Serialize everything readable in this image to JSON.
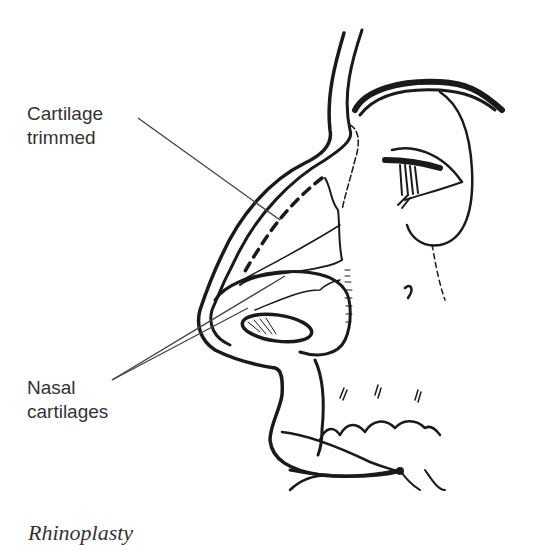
{
  "figure": {
    "caption": "Rhinoplasty",
    "labels": [
      {
        "lines": [
          "Cartilage",
          "trimmed"
        ],
        "points_to": "dashed line along nasal bridge"
      },
      {
        "lines": [
          "Nasal",
          "cartilages"
        ],
        "points_to": "lower nasal cartilages (two leader lines)"
      }
    ]
  },
  "colors": {
    "ink": "#1a1a1a",
    "label_text": "#333333",
    "leader_line": "#444444",
    "background": "#ffffff"
  }
}
